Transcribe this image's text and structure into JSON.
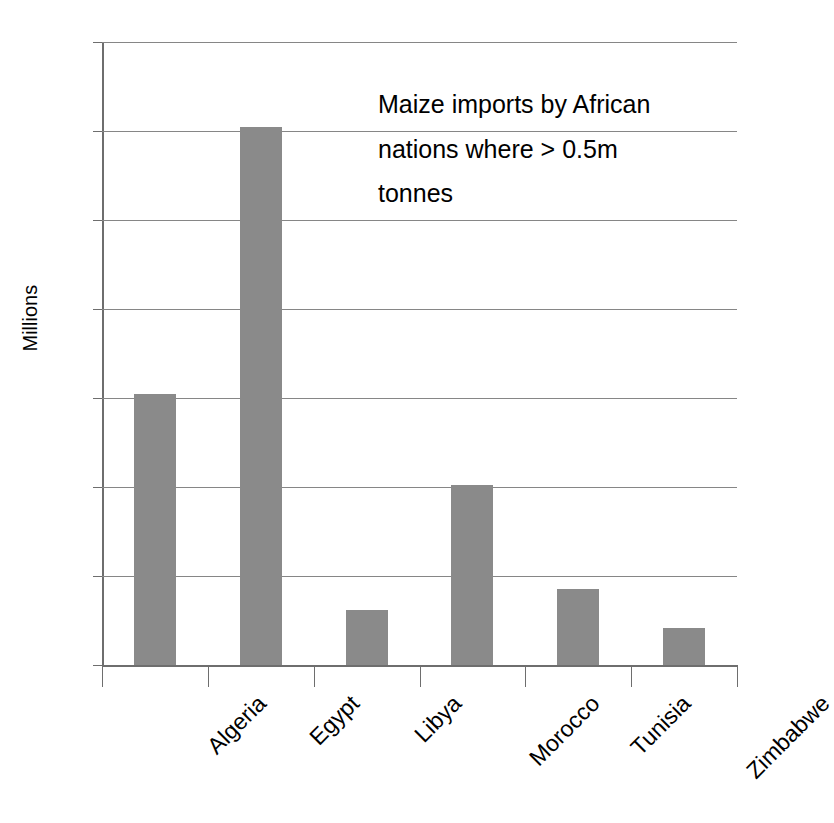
{
  "chart_data": {
    "type": "bar",
    "title_lines": [
      "Maize imports by African",
      "nations where > 0.5m",
      "tonnes"
    ],
    "xlabel": "",
    "ylabel": "Millions",
    "categories": [
      "Algeria",
      "Egypt",
      "Libya",
      "Morocco",
      "Tunisia",
      "Zimbabwe"
    ],
    "values": [
      3.05,
      6.05,
      0.62,
      2.02,
      0.85,
      0.42
    ],
    "ylim": [
      0,
      7
    ],
    "ytick_labels": [
      "0",
      "1",
      "2",
      "3",
      "4",
      "5",
      "6",
      "7"
    ],
    "ytick_values": [
      0,
      1,
      2,
      3,
      4,
      5,
      6,
      7
    ],
    "grid": true,
    "legend": false,
    "bar_color": "#8a8a8a",
    "gridline_color": "#868686",
    "axis_color": "#6e6e6e"
  }
}
